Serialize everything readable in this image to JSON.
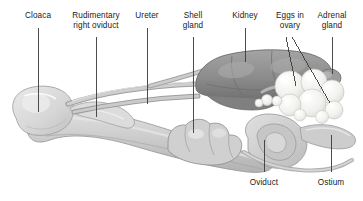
{
  "figure": {
    "background_color": "#ffffff",
    "width": 363,
    "height": 201
  },
  "labels": {
    "top": [
      {
        "id": "cloaca",
        "text": "Cloaca",
        "x": 38,
        "text_y": 11,
        "line_from_y": 28,
        "line_to_y": 112
      },
      {
        "id": "rudimentary-right-oviduct",
        "text": "Rudimentary\nright oviduct",
        "x": 96,
        "text_y": 11,
        "line_from_y": 37,
        "line_to_y": 117
      },
      {
        "id": "ureter",
        "text": "Ureter",
        "x": 147,
        "text_y": 11,
        "line_from_y": 28,
        "line_to_y": 104
      },
      {
        "id": "shell-gland",
        "text": "Shell\ngland",
        "x": 193,
        "text_y": 11,
        "line_from_y": 37,
        "line_to_y": 133
      },
      {
        "id": "kidney",
        "text": "Kidney",
        "x": 245,
        "text_y": 11,
        "line_from_y": 28,
        "line_to_y": 62
      },
      {
        "id": "eggs-in-ovary",
        "text": "Eggs in\novary",
        "x": 290,
        "text_y": 11,
        "line_from_y": 37,
        "line_to_y": 37
      },
      {
        "id": "adrenal-gland",
        "text": "Adrenal\ngland",
        "x": 332,
        "text_y": 11,
        "line_from_y": 37,
        "line_to_y": 74
      }
    ],
    "bottom": [
      {
        "id": "oviduct",
        "text": "Oviduct",
        "x": 264,
        "text_y": 178,
        "line_from_y": 140,
        "line_to_y": 172
      },
      {
        "id": "ostium",
        "text": "Ostium",
        "x": 331,
        "text_y": 178,
        "line_from_y": 135,
        "line_to_y": 172
      }
    ]
  },
  "leader_lines": {
    "color": "#3a3a3a",
    "width": 0.9,
    "eggs_in_ovary_branches": [
      {
        "id": "eggs-branch-left",
        "x1": 286,
        "y1": 37,
        "x2": 296,
        "y2": 86
      },
      {
        "id": "eggs-branch-right",
        "x1": 292,
        "y1": 37,
        "x2": 330,
        "y2": 103
      }
    ]
  },
  "anatomy": {
    "palette": {
      "outline": "#8c8c8c",
      "cloaca_fill": "#dcdcdc",
      "cloaca_shade": "#c8c8c8",
      "body_fill": "#c9c9c9",
      "body_light": "#dedede",
      "body_shade": "#b0b0b0",
      "shell_gland": "#cfcfcf",
      "kidney_fill": "#8f8f8f",
      "kidney_dark": "#757575",
      "kidney_light": "#a6a6a6",
      "ovary_egg": "#f2f2f0",
      "ovary_egg_shade": "#e2e2de",
      "duct_fill": "#bdbdbd",
      "ostium_fill": "#d4d4d4"
    },
    "parts": [
      {
        "id": "cloaca",
        "description": "pale rounded bulb at far left"
      },
      {
        "id": "oviduct-body",
        "description": "long tapering tube running lower-left to right"
      },
      {
        "id": "shell-gland",
        "description": "lumpy segmented swelling mid-illustration"
      },
      {
        "id": "kidney",
        "description": "dark lobed mass across upper right"
      },
      {
        "id": "ovary-eggs",
        "description": "cluster of bright white spheres (follicles)"
      },
      {
        "id": "adrenal-gland",
        "description": "small nodule at right end of kidney"
      },
      {
        "id": "ostium",
        "description": "coiled funnel at lower right"
      },
      {
        "id": "ureter",
        "description": "slender duct from kidney toward cloaca"
      },
      {
        "id": "rudimentary-right-oviduct",
        "description": "small stub near cloaca"
      }
    ]
  }
}
